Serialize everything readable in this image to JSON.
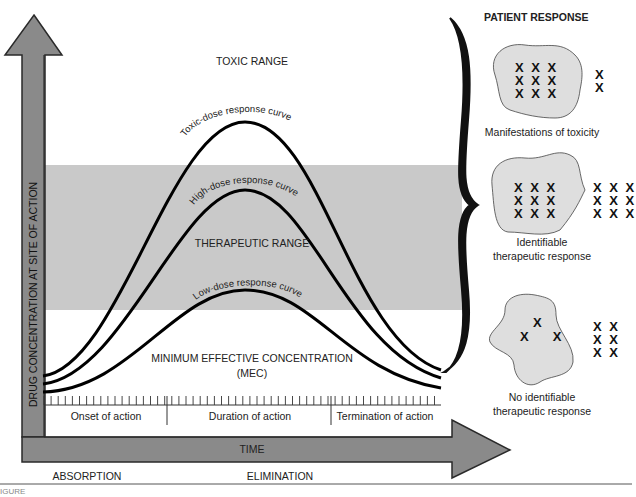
{
  "chart": {
    "y_axis_label": "DRUG CONCENTRATION AT SITE OF ACTION",
    "x_axis_label": "TIME",
    "ranges": {
      "toxic": "TOXIC RANGE",
      "therapeutic": "THERAPEUTIC RANGE",
      "mec_line1": "MINIMUM EFFECTIVE CONCENTRATION",
      "mec_line2": "(MEC)"
    },
    "curves": {
      "toxic": "Toxic-dose response curve",
      "high": "High-dose response curve",
      "low": "Low-dose response curve"
    },
    "phases": {
      "onset": "Onset of action",
      "duration": "Duration of action",
      "termination": "Termination of action"
    },
    "bottom": {
      "absorption": "ABSORPTION",
      "elimination": "ELIMINATION"
    },
    "caption": "IGURE"
  },
  "patient_response": {
    "title": "PATIENT RESPONSE",
    "items": [
      {
        "inside": "X X X\nX X X\nX X X",
        "outside": "X\nX",
        "label_line1": "Manifestations of toxicity",
        "label_line2": ""
      },
      {
        "inside": "X X X\nX X X\nX X X",
        "outside": "X X X\nX X X\nX X X",
        "label_line1": "Identifiable",
        "label_line2": "therapeutic response"
      },
      {
        "inside_top": "X",
        "inside_bottom": "X     X",
        "outside": "X X\nX X\nX X",
        "label_line1": "No identifiable",
        "label_line2": "therapeutic response"
      }
    ]
  },
  "colors": {
    "arrow_fill": "#8a8a8a",
    "arrow_stroke": "#2a2a2a",
    "band": "#c9c9c9",
    "blob": "#dedede",
    "curve": "#000000"
  },
  "chart_data": {
    "type": "line",
    "title": "",
    "xlabel": "TIME",
    "ylabel": "DRUG CONCENTRATION AT SITE OF ACTION",
    "bands": [
      {
        "name": "TOXIC RANGE",
        "position": "top"
      },
      {
        "name": "THERAPEUTIC RANGE",
        "position": "middle",
        "shaded": true
      },
      {
        "name": "MINIMUM EFFECTIVE CONCENTRATION (MEC)",
        "position": "bottom"
      }
    ],
    "series": [
      {
        "name": "Toxic-dose response curve",
        "shape": "bell",
        "peak_region": "toxic"
      },
      {
        "name": "High-dose response curve",
        "shape": "bell",
        "peak_region": "therapeutic (upper)"
      },
      {
        "name": "Low-dose response curve",
        "shape": "bell",
        "peak_region": "therapeutic (lower edge)"
      }
    ],
    "x_phases": [
      "Onset of action",
      "Duration of action",
      "Termination of action"
    ],
    "x_bottom_labels": [
      "ABSORPTION",
      "ELIMINATION"
    ]
  }
}
